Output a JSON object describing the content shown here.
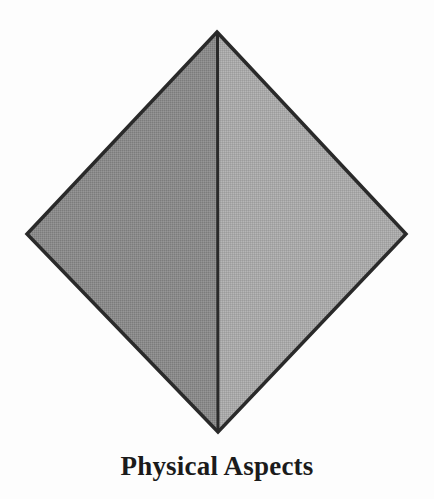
{
  "figure": {
    "caption": "Physical Aspects",
    "background_color": "#fdfdfd",
    "shape": {
      "name": "diamond",
      "type": "rhombus",
      "outline_color": "#2a2a2a",
      "outline_width": 3.5,
      "vertices": {
        "top": [
          217,
          32
        ],
        "left": [
          27,
          234
        ],
        "right": [
          406,
          234
        ],
        "bottom": [
          218,
          432
        ]
      },
      "divider": {
        "name": "vertical-center-divider",
        "from": [
          217,
          32
        ],
        "to": [
          218,
          432
        ],
        "color": "#2a2a2a",
        "width": 3
      },
      "halves": [
        {
          "name": "left-half",
          "label": "",
          "fill_color": "#8a8a8a"
        },
        {
          "name": "right-half",
          "label": "",
          "fill_color": "#a8a8a8"
        }
      ]
    }
  }
}
